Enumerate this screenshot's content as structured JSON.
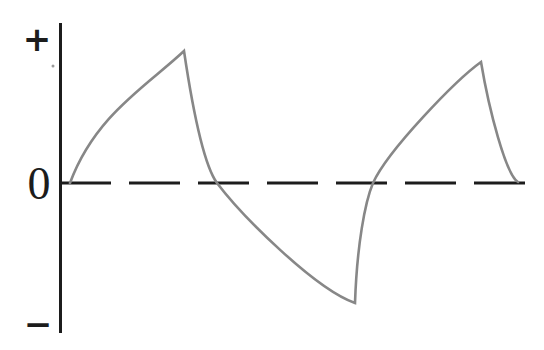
{
  "figure": {
    "width": 544,
    "height": 350,
    "background": "#ffffff",
    "axis": {
      "color": "#1c1c1c",
      "plus_label": "+",
      "zero_label": "0",
      "minus_label": "−",
      "y_axis_px": {
        "x": 60.5,
        "y_top": 23,
        "y_bottom": 333,
        "stroke_width": 3
      },
      "zero_line_px": {
        "y": 183,
        "x_start": 60,
        "x_end": 525,
        "dash_pattern": "51 18",
        "stroke_width": 3
      },
      "tick_speck_px": {
        "x": 53,
        "y": 66,
        "radius": 1.5,
        "color": "#9a9a9a"
      }
    },
    "curve": {
      "color": "#878787",
      "stroke_width": 2.6
    }
  },
  "chart_data": {
    "type": "line",
    "title": "",
    "y_tick_labels": [
      "+",
      "0",
      "−"
    ],
    "x_axis_label": "",
    "x_axis_visible": false,
    "zero_line_style": "long-dash",
    "amplitude_range": [
      -1,
      1
    ],
    "key_points_normalized": [
      {
        "t": 0.0,
        "v": 0.0,
        "point": "start-at-zero"
      },
      {
        "t": 0.26,
        "v": 1.0,
        "point": "peak-1"
      },
      {
        "t": 0.33,
        "v": 0.0,
        "point": "zero-crossing-falling"
      },
      {
        "t": 0.64,
        "v": -0.91,
        "point": "trough"
      },
      {
        "t": 0.68,
        "v": 0.0,
        "point": "zero-crossing-rising"
      },
      {
        "t": 0.92,
        "v": 0.92,
        "point": "peak-2"
      },
      {
        "t": 1.0,
        "v": 0.01,
        "point": "end-at-zero"
      }
    ],
    "curve_path_px": {
      "start": [
        70,
        183
      ],
      "beziers": [
        {
          "c1": [
            95,
            115
          ],
          "c2": [
            148,
            85
          ],
          "to": [
            184,
            51
          ],
          "segment": "exponential-rise-1"
        },
        {
          "c1": [
            195,
            125
          ],
          "c2": [
            206,
            168
          ],
          "to": [
            217,
            183
          ],
          "segment": "decay-fall-1-upper"
        },
        {
          "c1": [
            242,
            216
          ],
          "c2": [
            315,
            289
          ],
          "to": [
            355,
            303
          ],
          "segment": "decay-fall-1-lower"
        },
        {
          "c1": [
            357,
            245
          ],
          "c2": [
            365,
            202
          ],
          "to": [
            373,
            183
          ],
          "segment": "exponential-rise-2-lower"
        },
        {
          "c1": [
            388,
            150
          ],
          "c2": [
            456,
            80
          ],
          "to": [
            481,
            62
          ],
          "segment": "exponential-rise-2-upper"
        },
        {
          "c1": [
            489,
            110
          ],
          "c2": [
            506,
            175
          ],
          "to": [
            518,
            182
          ],
          "segment": "decay-fall-2"
        }
      ]
    }
  }
}
